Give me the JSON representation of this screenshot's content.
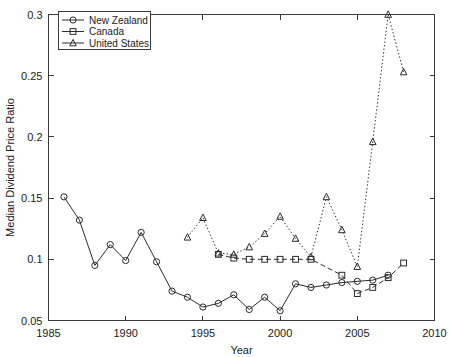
{
  "chart_data": {
    "type": "line",
    "title": "",
    "xlabel": "Year",
    "ylabel": "Median Dividend Price Ratio",
    "xlim": [
      1985,
      2010
    ],
    "ylim": [
      0.05,
      0.3
    ],
    "xticks": [
      "1985",
      "1990",
      "1995",
      "2000",
      "2005",
      "2010"
    ],
    "xtick_values": [
      1985,
      1990,
      1995,
      2000,
      2005,
      2010
    ],
    "yticks": [
      "0.05",
      "0.1",
      "0.15",
      "0.2",
      "0.25",
      "0.3"
    ],
    "ytick_values": [
      0.05,
      0.1,
      0.15,
      0.2,
      0.25,
      0.3
    ],
    "grid": false,
    "legend_position": "top-left",
    "series": [
      {
        "name": "New Zealand",
        "marker": "circle",
        "linestyle": "solid",
        "x": [
          1986,
          1987,
          1988,
          1989,
          1990,
          1991,
          1992,
          1993,
          1994,
          1995,
          1996,
          1997,
          1998,
          1999,
          2000,
          2001,
          2002,
          2003,
          2004,
          2005,
          2006,
          2007
        ],
        "values": [
          0.151,
          0.132,
          0.095,
          0.112,
          0.099,
          0.122,
          0.098,
          0.074,
          0.069,
          0.061,
          0.064,
          0.071,
          0.059,
          0.069,
          0.058,
          0.08,
          0.077,
          0.079,
          0.081,
          0.082,
          0.083,
          0.087
        ]
      },
      {
        "name": "Canada",
        "marker": "square",
        "linestyle": "dashed",
        "x": [
          1996,
          1997,
          1998,
          1999,
          2000,
          2001,
          2002,
          2004,
          2005,
          2006,
          2007,
          2008
        ],
        "values": [
          0.104,
          0.101,
          0.1,
          0.1,
          0.1,
          0.1,
          0.1,
          0.087,
          0.072,
          0.077,
          0.085,
          0.097
        ]
      },
      {
        "name": "United States",
        "marker": "triangle",
        "linestyle": "dotted",
        "x": [
          1994,
          1995,
          1996,
          1997,
          1998,
          1999,
          2000,
          2001,
          2002,
          2003,
          2004,
          2005,
          2006,
          2007,
          2008
        ],
        "values": [
          0.118,
          0.134,
          0.105,
          0.104,
          0.11,
          0.121,
          0.135,
          0.117,
          0.102,
          0.151,
          0.124,
          0.094,
          0.196,
          0.3,
          0.253
        ]
      }
    ]
  }
}
